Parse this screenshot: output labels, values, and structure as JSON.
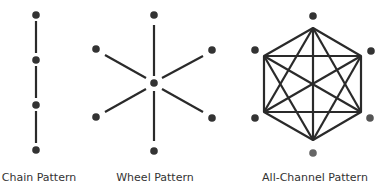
{
  "patterns": [
    {
      "id": "chain",
      "label": "Chain Pattern",
      "label_x": 39
    },
    {
      "id": "wheel",
      "label": "Wheel Pattern",
      "label_x": 155
    },
    {
      "id": "all-channel",
      "label": "All-Channel Pattern",
      "label_x": 315
    }
  ],
  "colors": {
    "node": "#333333",
    "line": "#2a2a2a"
  }
}
